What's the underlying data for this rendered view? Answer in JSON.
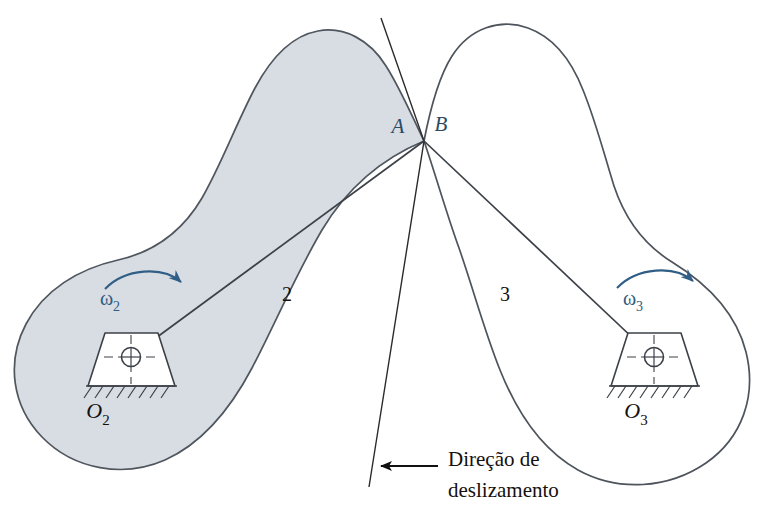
{
  "figure": {
    "type": "kinematics-diagram",
    "background_color": "#ffffff"
  },
  "colors": {
    "body2_fill": "#d7dde3",
    "body2_stroke": "#50565e",
    "body3_fill": "#ffffff",
    "body3_stroke": "#4e545c",
    "omega_label": "#2f5b80",
    "omega_arrow": "#315e86",
    "point_label": "#2d4a63",
    "black_text": "#15100e",
    "line_color": "#3c4148",
    "tangent_line": "#2b2b2b",
    "arrow_black": "#111111"
  },
  "bodies": [
    {
      "id": "body-2",
      "number_label": "2",
      "number_pos": {
        "x": 287,
        "y": 301
      },
      "filled": true
    },
    {
      "id": "body-3",
      "number_label": "3",
      "number_pos": {
        "x": 505,
        "y": 301
      },
      "filled": false
    }
  ],
  "contact": {
    "point": {
      "x": 424,
      "y": 141
    },
    "label_left": "A",
    "label_left_pos": {
      "x": 398,
      "y": 133
    },
    "label_right": "B",
    "label_right_pos": {
      "x": 441,
      "y": 131
    }
  },
  "pivots": [
    {
      "id": "pivot-o2",
      "label": "O",
      "subscript": "2",
      "label_pos": {
        "x": 98,
        "y": 418
      },
      "center": {
        "x": 130,
        "y": 357
      }
    },
    {
      "id": "pivot-o3",
      "label": "O",
      "subscript": "3",
      "label_pos": {
        "x": 636,
        "y": 418
      },
      "center": {
        "x": 653,
        "y": 357
      }
    }
  ],
  "angular_velocities": [
    {
      "id": "omega-2",
      "symbol": "ω",
      "subscript": "2",
      "label_pos": {
        "x": 110,
        "y": 305
      },
      "direction": "clockwise"
    },
    {
      "id": "omega-3",
      "symbol": "ω",
      "subscript": "3",
      "label_pos": {
        "x": 633,
        "y": 305
      },
      "direction": "clockwise"
    }
  ],
  "annotation": {
    "id": "sliding-direction",
    "line1": "Direção de",
    "line2": "deslizamento",
    "line1_pos": {
      "x": 448,
      "y": 466
    },
    "line2_pos": {
      "x": 448,
      "y": 497
    },
    "arrow": {
      "from": {
        "x": 438,
        "y": 466
      },
      "to": {
        "x": 369,
        "y": 466
      }
    }
  },
  "lines": [
    {
      "id": "radius-o2-a",
      "from": {
        "x": 130,
        "y": 357
      },
      "to": {
        "x": 424,
        "y": 141
      }
    },
    {
      "id": "radius-o3-b",
      "from": {
        "x": 653,
        "y": 357
      },
      "to": {
        "x": 424,
        "y": 141
      }
    },
    {
      "id": "tangent-line",
      "from": {
        "x": 381,
        "y": 18
      },
      "to": {
        "x": 369,
        "y": 487
      }
    }
  ]
}
